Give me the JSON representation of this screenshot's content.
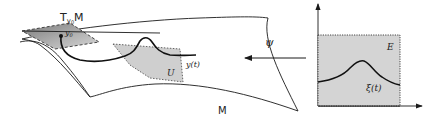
{
  "diagram": {
    "labels": {
      "tangent_plane": "T",
      "tangent_plane_sub": "y",
      "tangent_plane_subsub": "0",
      "tangent_plane_suffix": "M",
      "point": "y",
      "point_sub": "0",
      "manifold": "M",
      "patch": "U",
      "curve_on_manifold": "y(t)",
      "map": "ψ",
      "chart_region": "E",
      "curve_in_chart": "ξ(t)"
    },
    "colors": {
      "stroke": "#1a1a1a",
      "tangent_plane_fill": "#8f8f8f",
      "patch_fill": "#cfcfcf",
      "chart_fill": "#d4d4d4",
      "background": "#ffffff"
    }
  }
}
